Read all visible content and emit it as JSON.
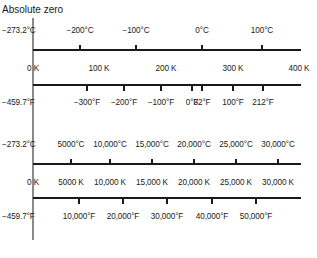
{
  "title": "Absolute zero",
  "panels": [
    {
      "name": "low-range",
      "celsius_labels": [
        {
          "x": 33,
          "text": "−273.2°C",
          "tick": false,
          "left": 2
        },
        {
          "x": 80,
          "text": "−200°C",
          "tick": true
        },
        {
          "x": 136,
          "text": "−100°C",
          "tick": true
        },
        {
          "x": 202,
          "text": "0°C",
          "tick": true
        },
        {
          "x": 262,
          "text": "100°C",
          "tick": true
        }
      ],
      "kelvin_labels": [
        {
          "x": 33,
          "text": "0 K",
          "tick": false
        },
        {
          "x": 99,
          "text": "100 K",
          "tick": false
        },
        {
          "x": 166,
          "text": "200 K",
          "tick": false
        },
        {
          "x": 233,
          "text": "300 K",
          "tick": false
        },
        {
          "x": 299,
          "text": "400 K",
          "tick": false
        }
      ],
      "fahrenheit_labels": [
        {
          "x": 33,
          "text": "−459.7°F",
          "tick": false,
          "left": 2
        },
        {
          "x": 87,
          "text": "−300°F",
          "tick": true
        },
        {
          "x": 124,
          "text": "−200°F",
          "tick": true
        },
        {
          "x": 161,
          "text": "−100°F",
          "tick": true
        },
        {
          "x": 192,
          "text": "0°F",
          "tick": true
        },
        {
          "x": 202,
          "text": "32°F",
          "tick": true
        },
        {
          "x": 233,
          "text": "100°F",
          "tick": true
        },
        {
          "x": 263,
          "text": "212°F",
          "tick": true
        }
      ]
    },
    {
      "name": "high-range",
      "celsius_labels": [
        {
          "x": 33,
          "text": "−273.2°C",
          "tick": false,
          "left": 2
        },
        {
          "x": 71,
          "text": "5000°C",
          "tick": true
        },
        {
          "x": 110,
          "text": "10,000°C",
          "tick": true
        },
        {
          "x": 152,
          "text": "15,000°C",
          "tick": true
        },
        {
          "x": 194,
          "text": "20,000°C",
          "tick": true
        },
        {
          "x": 236,
          "text": "25,000°C",
          "tick": true
        },
        {
          "x": 278,
          "text": "30,000°C",
          "tick": true
        }
      ],
      "kelvin_labels": [
        {
          "x": 33,
          "text": "0 K",
          "tick": false
        },
        {
          "x": 71,
          "text": "5000 K",
          "tick": false
        },
        {
          "x": 110,
          "text": "10,000 K",
          "tick": false
        },
        {
          "x": 152,
          "text": "15,000 K",
          "tick": false
        },
        {
          "x": 194,
          "text": "20,000 K",
          "tick": false
        },
        {
          "x": 236,
          "text": "25,000 K",
          "tick": false
        },
        {
          "x": 278,
          "text": "30,000 K",
          "tick": false
        }
      ],
      "fahrenheit_labels": [
        {
          "x": 33,
          "text": "−459.7°F",
          "tick": false,
          "left": 2
        },
        {
          "x": 79,
          "text": "10,000°F",
          "tick": true
        },
        {
          "x": 123,
          "text": "20,000°F",
          "tick": true
        },
        {
          "x": 167,
          "text": "30,000°F",
          "tick": true
        },
        {
          "x": 212,
          "text": "40,000°F",
          "tick": true
        },
        {
          "x": 256,
          "text": "50,000°F",
          "tick": true
        }
      ]
    }
  ]
}
